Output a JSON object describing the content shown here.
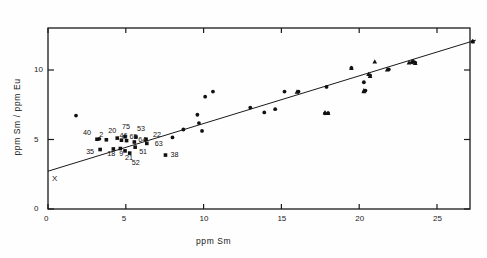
{
  "chart_data": {
    "type": "scatter",
    "title": "",
    "xlabel": "ppm  Sm",
    "ylabel": "ppm  Sm  /  ppm  Eu",
    "xlim": [
      0,
      27.5
    ],
    "ylim": [
      0,
      12.8
    ],
    "xticks": [
      0,
      5,
      10,
      15,
      20,
      25
    ],
    "xticklabels": [
      "0",
      "5",
      "10",
      "15",
      "20",
      "25"
    ],
    "yticks": [
      0,
      5,
      10
    ],
    "yticklabels": [
      "0",
      "5",
      "10"
    ],
    "grid": false,
    "legend": "none",
    "trend_line": {
      "x0": 0.0,
      "y0": 2.72,
      "x1": 27.5,
      "y1": 12.15
    },
    "origin_marker": {
      "label": "X",
      "x": 0.25,
      "y": 2.05
    },
    "series": [
      {
        "name": "circles",
        "marker": "circle",
        "points": [
          {
            "x": 1.8,
            "y": 6.72
          },
          {
            "x": 3.3,
            "y": 5.05
          },
          {
            "x": 8.0,
            "y": 5.15
          },
          {
            "x": 8.7,
            "y": 5.72
          },
          {
            "x": 9.7,
            "y": 6.18
          },
          {
            "x": 9.9,
            "y": 5.62
          },
          {
            "x": 9.6,
            "y": 6.78
          },
          {
            "x": 10.6,
            "y": 8.45
          },
          {
            "x": 10.1,
            "y": 8.08
          },
          {
            "x": 13.0,
            "y": 7.3
          },
          {
            "x": 13.9,
            "y": 6.95
          },
          {
            "x": 14.6,
            "y": 7.18
          },
          {
            "x": 15.2,
            "y": 8.45
          },
          {
            "x": 16.1,
            "y": 8.45
          },
          {
            "x": 17.8,
            "y": 6.88
          },
          {
            "x": 18.0,
            "y": 6.9
          },
          {
            "x": 17.9,
            "y": 8.78
          },
          {
            "x": 19.5,
            "y": 10.15
          },
          {
            "x": 20.3,
            "y": 9.12
          },
          {
            "x": 20.4,
            "y": 8.52
          },
          {
            "x": 20.7,
            "y": 9.62
          },
          {
            "x": 21.9,
            "y": 10.05
          },
          {
            "x": 23.4,
            "y": 10.55
          },
          {
            "x": 23.6,
            "y": 10.52
          },
          {
            "x": 27.3,
            "y": 12.05
          }
        ]
      },
      {
        "name": "triangles",
        "marker": "triangle",
        "points": [
          {
            "x": 16.0,
            "y": 8.42
          },
          {
            "x": 17.8,
            "y": 6.92
          },
          {
            "x": 18.0,
            "y": 6.88
          },
          {
            "x": 19.5,
            "y": 10.12
          },
          {
            "x": 20.3,
            "y": 8.5
          },
          {
            "x": 20.7,
            "y": 9.55
          },
          {
            "x": 20.6,
            "y": 9.68
          },
          {
            "x": 21.0,
            "y": 10.58
          },
          {
            "x": 21.8,
            "y": 10.02
          },
          {
            "x": 23.2,
            "y": 10.52
          },
          {
            "x": 23.4,
            "y": 10.6
          },
          {
            "x": 23.6,
            "y": 10.48
          },
          {
            "x": 23.5,
            "y": 10.62
          },
          {
            "x": 27.3,
            "y": 12.05
          },
          {
            "x": 20.3,
            "y": 8.45
          }
        ]
      },
      {
        "name": "labeled-squares",
        "marker": "square",
        "points": [
          {
            "x": 3.15,
            "y": 5.02,
            "label": "40",
            "lx": -14,
            "ly": -7
          },
          {
            "x": 3.75,
            "y": 4.98,
            "label": "2",
            "lx": -7,
            "ly": -6
          },
          {
            "x": 4.45,
            "y": 5.1,
            "label": "20",
            "lx": -9,
            "ly": -8
          },
          {
            "x": 4.95,
            "y": 5.2,
            "label": "75",
            "lx": -3,
            "ly": -11
          },
          {
            "x": 5.65,
            "y": 5.18,
            "label": "53",
            "lx": 1,
            "ly": -9
          },
          {
            "x": 3.35,
            "y": 4.28,
            "label": "35",
            "lx": -14,
            "ly": 1
          },
          {
            "x": 4.2,
            "y": 4.32,
            "label": "18",
            "lx": -6,
            "ly": 4
          },
          {
            "x": 4.65,
            "y": 4.35,
            "label": "9",
            "lx": -1,
            "ly": 4
          },
          {
            "x": 4.72,
            "y": 4.95,
            "label": "46",
            "lx": -2,
            "ly": -5
          },
          {
            "x": 5.05,
            "y": 4.92,
            "label": "65",
            "lx": 3,
            "ly": -5
          },
          {
            "x": 5.55,
            "y": 4.82,
            "label": "64",
            "lx": 4,
            "ly": -3
          },
          {
            "x": 6.3,
            "y": 5.02,
            "label": "22",
            "lx": 7,
            "ly": -5
          },
          {
            "x": 6.35,
            "y": 4.72,
            "label": "63",
            "lx": 8,
            "ly": 0
          },
          {
            "x": 4.95,
            "y": 4.18,
            "label": "21",
            "lx": 0,
            "ly": 6
          },
          {
            "x": 5.6,
            "y": 4.45,
            "label": "51",
            "lx": 4,
            "ly": 4
          },
          {
            "x": 5.25,
            "y": 4.02,
            "label": "52",
            "lx": 2,
            "ly": 9
          },
          {
            "x": 7.55,
            "y": 3.88,
            "label": "38",
            "lx": 5,
            "ly": -1
          }
        ]
      }
    ]
  },
  "figure": {
    "xtitle": "ppm    Sm",
    "ytitle": "ppm  Sm  /  ppm  Eu"
  }
}
